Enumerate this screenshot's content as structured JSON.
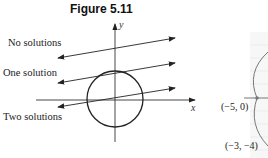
{
  "figure": {
    "title": "Figure 5.11",
    "axes": {
      "x_label": "x",
      "y_label": "y"
    },
    "line_labels": [
      {
        "id": "no",
        "label": "No solutions"
      },
      {
        "id": "one",
        "label": "One solution"
      },
      {
        "id": "two",
        "label": "Two solutions"
      }
    ]
  },
  "side_figure": {
    "points": [
      {
        "label": "(−5, 0)"
      },
      {
        "label": "(−3, −4)"
      }
    ]
  },
  "colors": {
    "ink": "#222222",
    "grid": "#e6e6e6",
    "side_curve": "#777777"
  }
}
